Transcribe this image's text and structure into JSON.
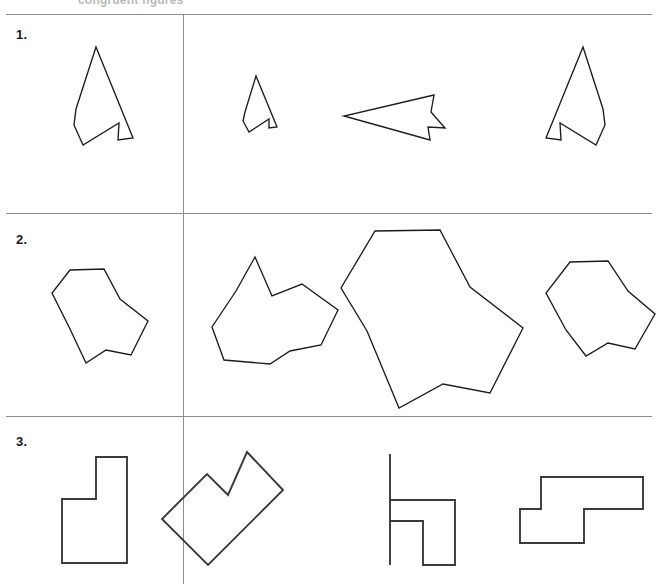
{
  "page": {
    "width": 656,
    "height": 584,
    "background_color": "#ffffff",
    "line_color": "#8c8c8c",
    "shape_stroke_color": "#1c1c1c",
    "cropped_header_text": "congruent figures"
  },
  "dividers": {
    "horizontal_rules": [
      {
        "name": "rule-top",
        "y": 14
      },
      {
        "name": "rule-between-1-and-2",
        "y": 213
      },
      {
        "name": "rule-between-2-and-3",
        "y": 416
      }
    ],
    "vertical_rule": {
      "name": "reference-answer-divider",
      "x": 183,
      "top": 14,
      "bottom": 584
    }
  },
  "rows": [
    {
      "number": "1.",
      "label_x": 16,
      "label_y": 27,
      "reference": {
        "name": "reference-shape-arrow",
        "points": "96,47 133,138 118,140 119,123 83,145 74,125 76,109"
      },
      "options": [
        {
          "name": "option-1-a",
          "points": "256,76 277,127 269,128 269,119 249,132 243,121 245,112"
        },
        {
          "name": "option-1-b",
          "points": "434,95 344,116 430,140 428,127 445,128 431,112"
        },
        {
          "name": "option-1-c",
          "points": "583,47 546,138 561,140 560,123 596,145 605,125 603,109"
        }
      ]
    },
    {
      "number": "2.",
      "label_x": 16,
      "label_y": 232,
      "reference": {
        "name": "reference-shape-blob",
        "points": "70,270 104,269 120,299 148,321 131,355 106,350 86,363 70,329 52,293"
      },
      "options": [
        {
          "name": "option-2-a",
          "points": "255,257 272,296 302,284 338,310 321,345 290,351 270,364 224,360 212,327 236,291"
        },
        {
          "name": "option-2-b",
          "points": "375,231 440,230 470,287 523,328 490,393 443,384 399,408 367,331 341,288"
        },
        {
          "name": "option-2-c",
          "points": "570,262 608,261 628,291 655,314 635,349 608,343 586,356 566,330 546,293"
        }
      ]
    },
    {
      "number": "3.",
      "label_x": 16,
      "label_y": 434,
      "reference": {
        "name": "reference-shape-zigzag",
        "points": "96,457 127,457 127,563 62,563 62,499 96,499"
      },
      "options": [
        {
          "name": "option-3-a",
          "points": "247,452 283,490 208,565 162,519 207,474 228,495"
        },
        {
          "name": "option-3-b",
          "points": "390,454 390,500 455,500 455,565 423,565 423,521 390,521 390,565 390,565"
        },
        {
          "name": "option-3-c",
          "points": "541,477 643,477 643,509 584,509 584,543 520,543 520,509 541,509"
        }
      ]
    }
  ]
}
